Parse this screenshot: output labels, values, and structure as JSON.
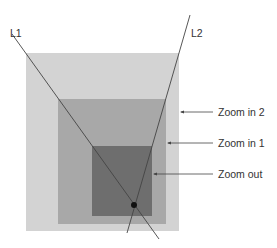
{
  "diagram": {
    "lines": [
      {
        "label": "L1",
        "x1": 12,
        "y1": 34,
        "x2": 159,
        "y2": 239,
        "label_x": 10,
        "label_y": 37
      },
      {
        "label": "L2",
        "x1": 190,
        "y1": 15,
        "x2": 127,
        "y2": 233,
        "label_x": 191,
        "label_y": 37
      }
    ],
    "regions": [
      {
        "name": "Zoom in 2",
        "x": 26,
        "y": 53,
        "w": 153,
        "h": 178,
        "color": "#d3d3d3"
      },
      {
        "name": "Zoom in 1",
        "x": 58,
        "y": 99,
        "w": 108,
        "h": 125,
        "color": "#a8a8a8"
      },
      {
        "name": "Zoom out",
        "x": 92,
        "y": 146,
        "w": 60,
        "h": 70,
        "color": "#6e6e6e"
      }
    ],
    "callouts": [
      {
        "text": "Zoom in 2",
        "arrow_from_x": 213,
        "arrow_to_x": 180,
        "y": 112,
        "text_x": 218
      },
      {
        "text": "Zoom in 1",
        "arrow_from_x": 213,
        "arrow_to_x": 167,
        "y": 143,
        "text_x": 218
      },
      {
        "text": "Zoom out",
        "arrow_from_x": 213,
        "arrow_to_x": 153,
        "y": 174,
        "text_x": 218
      }
    ],
    "intersection_point": {
      "x": 134,
      "y": 205,
      "r": 3
    }
  }
}
